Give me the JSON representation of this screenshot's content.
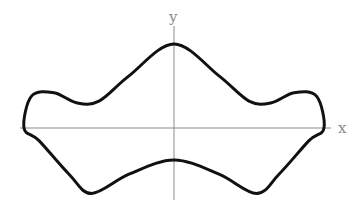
{
  "chart_data": {
    "type": "line",
    "title": "",
    "xlabel": "x",
    "ylabel": "y",
    "grid": false,
    "xlim": [
      -1.2,
      1.2
    ],
    "ylim": [
      -1.0,
      1.2
    ],
    "series": [
      {
        "name": "upper-boundary",
        "x": [
          -1.0,
          -0.95,
          -0.8,
          -0.65,
          -0.5,
          -0.3,
          0.0,
          0.3,
          0.5,
          0.65,
          0.8,
          0.95,
          1.0
        ],
        "y": [
          0.0,
          0.38,
          0.42,
          0.3,
          0.32,
          0.62,
          1.0,
          0.62,
          0.32,
          0.3,
          0.42,
          0.38,
          0.0
        ]
      },
      {
        "name": "lower-boundary",
        "x": [
          -1.0,
          -0.9,
          -0.7,
          -0.55,
          -0.3,
          0.0,
          0.3,
          0.55,
          0.7,
          0.9,
          1.0
        ],
        "y": [
          0.0,
          -0.15,
          -0.55,
          -0.78,
          -0.55,
          -0.38,
          -0.55,
          -0.78,
          -0.55,
          -0.15,
          0.0
        ]
      }
    ]
  }
}
